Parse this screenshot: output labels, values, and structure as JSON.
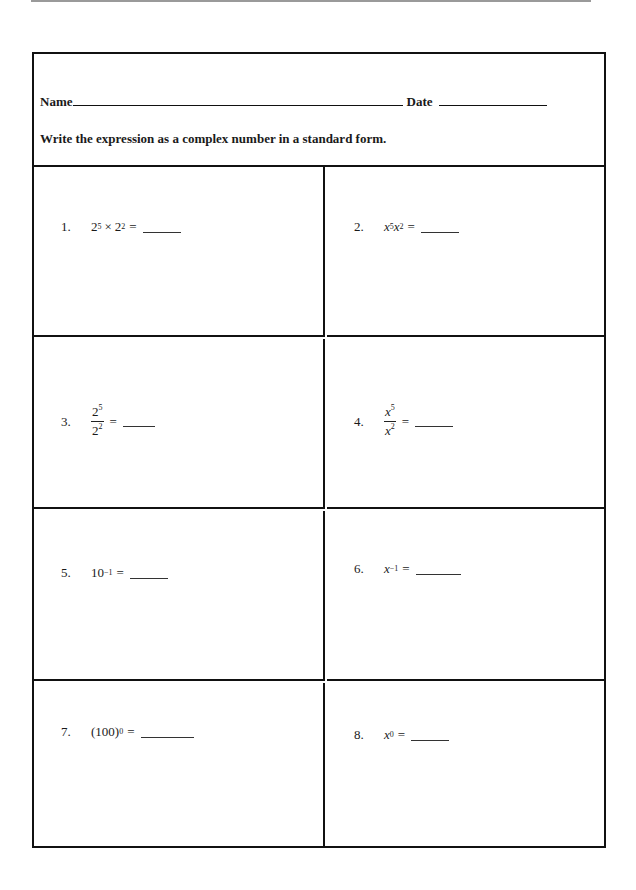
{
  "header": {
    "name_label": "Name",
    "date_label": "Date",
    "instructions": "Write the expression as a complex number in a standard form."
  },
  "problems": [
    {
      "number": "1.",
      "base1": "2",
      "exp1": "5",
      "operator": "×",
      "base2": "2",
      "exp2": "2",
      "equals": "="
    },
    {
      "number": "2.",
      "base1": "x",
      "exp1": "5",
      "base2": "x",
      "exp2": "2",
      "equals": "="
    },
    {
      "number": "3.",
      "num_base": "2",
      "num_exp": "5",
      "den_base": "2",
      "den_exp": "2",
      "equals": "="
    },
    {
      "number": "4.",
      "num_base": "x",
      "num_exp": "5",
      "den_base": "x",
      "den_exp": "2",
      "equals": "="
    },
    {
      "number": "5.",
      "base": "10",
      "exp": "−1",
      "equals": "="
    },
    {
      "number": "6.",
      "base": "x",
      "exp": "−1",
      "equals": "="
    },
    {
      "number": "7.",
      "base": "(100)",
      "exp": "0",
      "equals": "="
    },
    {
      "number": "8.",
      "base": "x",
      "exp": "0",
      "equals": "="
    }
  ]
}
